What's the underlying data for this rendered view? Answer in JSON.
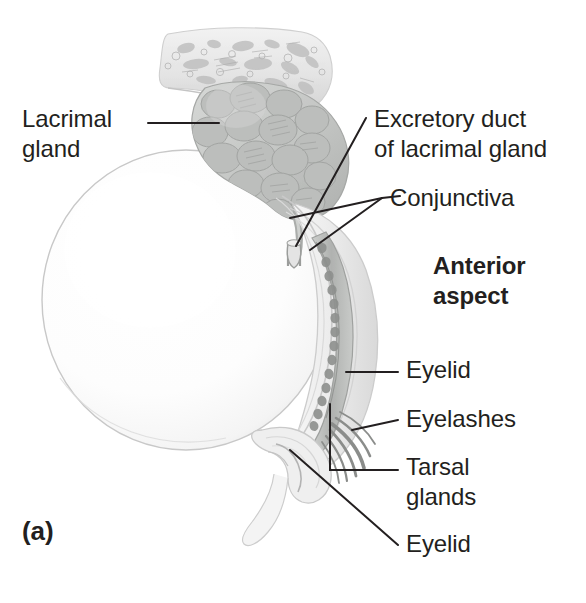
{
  "figure": {
    "panel_letter": "(a)",
    "orientation_note": "Anterior\naspect",
    "background_color": "#ffffff",
    "ink_color": "#231f20"
  },
  "labels": [
    {
      "id": "lacrimal-gland",
      "text": "Lacrimal\ngland",
      "bold": false
    },
    {
      "id": "excretory-duct",
      "text": "Excretory duct\nof lacrimal gland",
      "bold": false
    },
    {
      "id": "conjunctiva",
      "text": "Conjunctiva",
      "bold": false
    },
    {
      "id": "anterior-aspect",
      "text": "Anterior\naspect",
      "bold": true
    },
    {
      "id": "eyelid-upper",
      "text": "Eyelid",
      "bold": false
    },
    {
      "id": "eyelashes",
      "text": "Eyelashes",
      "bold": false
    },
    {
      "id": "tarsal-glands",
      "text": "Tarsal\nglands",
      "bold": false
    },
    {
      "id": "eyelid-lower",
      "text": "Eyelid",
      "bold": false
    },
    {
      "id": "panel-letter",
      "text": "(a)",
      "bold": true
    }
  ],
  "structures": [
    {
      "id": "orbital-bone",
      "name": "orbital bone (cancellous texture)",
      "fill": "#e9e9e9"
    },
    {
      "id": "lacrimal-gland",
      "name": "lacrimal gland (lobulated)",
      "fill": "#c6c8c6"
    },
    {
      "id": "excretory-duct",
      "name": "excretory duct of lacrimal gland",
      "fill": "#d8d8d8"
    },
    {
      "id": "eyeball",
      "name": "eyeball / sclera",
      "fill": "#fcfcfc"
    },
    {
      "id": "conjunctiva",
      "name": "conjunctival membrane",
      "fill": "#efefef"
    },
    {
      "id": "eyelid",
      "name": "eyelid (upper and lower)",
      "fill": "#ededed"
    },
    {
      "id": "tarsal-glands",
      "name": "tarsal (meibomian) glands",
      "fill": "#b9bbb9"
    },
    {
      "id": "eyelashes",
      "name": "eyelashes",
      "fill": "#8d8f8d"
    }
  ]
}
